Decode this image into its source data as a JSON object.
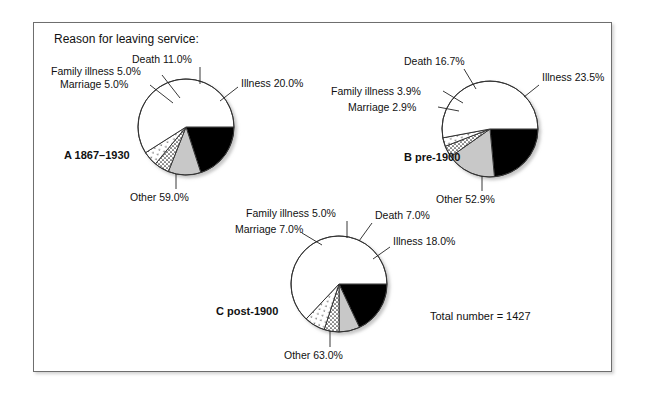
{
  "figure": {
    "heading": "Reason for leaving service:",
    "total_label": "Total number = 1427",
    "frame_border_color": "#6e6e6e"
  },
  "colors": {
    "illness": "#000000",
    "death": "#c8c8c8",
    "family_illness": "#ffffff",
    "marriage": "#ffffff",
    "other": "#ffffff",
    "outline": "#333333",
    "text": "#111111"
  },
  "chart_data": [
    {
      "type": "pie",
      "id": "A",
      "title": "A 1867–1930",
      "categories": [
        "Illness",
        "Death",
        "Family illness",
        "Marriage",
        "Other"
      ],
      "values": [
        20.0,
        11.0,
        5.0,
        5.0,
        59.0
      ],
      "labels": [
        "Illness 20.0%",
        "Death 11.0%",
        "Family illness 5.0%",
        "Marriage 5.0%",
        "Other 59.0%"
      ],
      "patterns": [
        "solid-black",
        "solid-gray",
        "dense-dots",
        "sparse-dots",
        "white"
      ],
      "start_angle_deg": 0,
      "direction": "clockwise",
      "center": [
        185,
        126
      ],
      "radius": 48
    },
    {
      "type": "pie",
      "id": "B",
      "title": "B pre-1900",
      "categories": [
        "Illness",
        "Death",
        "Family illness",
        "Marriage",
        "Other"
      ],
      "values": [
        23.5,
        16.7,
        3.9,
        2.9,
        52.9
      ],
      "labels": [
        "Illness 23.5%",
        "Death 16.7%",
        "Family illness 3.9%",
        "Marriage 2.9%",
        "Other 52.9%"
      ],
      "patterns": [
        "solid-black",
        "solid-gray",
        "dense-dots",
        "sparse-dots",
        "white"
      ],
      "start_angle_deg": 0,
      "direction": "clockwise",
      "center": [
        489,
        128
      ],
      "radius": 48
    },
    {
      "type": "pie",
      "id": "C",
      "title": "C post-1900",
      "categories": [
        "Illness",
        "Death",
        "Family illness",
        "Marriage",
        "Other"
      ],
      "values": [
        18.0,
        7.0,
        5.0,
        7.0,
        63.0
      ],
      "labels": [
        "Illness 18.0%",
        "Death 7.0%",
        "Family illness 5.0%",
        "Marriage 7.0%",
        "Other 63.0%"
      ],
      "patterns": [
        "solid-black",
        "solid-gray",
        "dense-dots",
        "sparse-dots",
        "white"
      ],
      "start_angle_deg": 0,
      "direction": "clockwise",
      "center": [
        338,
        283
      ],
      "radius": 48
    }
  ],
  "labels": {
    "a": {
      "death": "Death 11.0%",
      "family_illness": "Family illness 5.0%",
      "marriage": "Marriage 5.0%",
      "illness": "Illness 20.0%",
      "other": "Other 59.0%",
      "title": "A 1867–1930"
    },
    "b": {
      "death": "Death 16.7%",
      "family_illness": "Family illness 3.9%",
      "marriage": "Marriage 2.9%",
      "illness": "Illness 23.5%",
      "other": "Other 52.9%",
      "title": "B pre-1900"
    },
    "c": {
      "death": "Death 7.0%",
      "family_illness": "Family illness 5.0%",
      "marriage": "Marriage 7.0%",
      "illness": "Illness 18.0%",
      "other": "Other 63.0%",
      "title": "C post-1900"
    }
  }
}
